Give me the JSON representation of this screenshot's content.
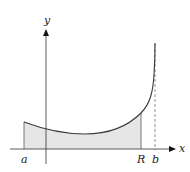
{
  "diagram": {
    "title": "",
    "labels": {
      "x_axis": "x",
      "y_axis": "y",
      "a": "a",
      "R": "R",
      "b": "b"
    },
    "colors": {
      "curve": "#3a3a3a",
      "axis": "#333333",
      "shade": "#e6e6e6",
      "asymptote": "#777777"
    }
  }
}
